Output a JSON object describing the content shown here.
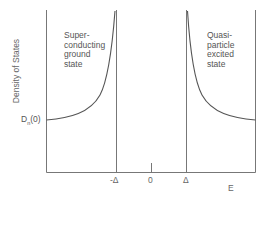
{
  "diagram": {
    "y_axis_label": "Density of States",
    "x_axis_label": "E",
    "y_reference_label": "D",
    "y_reference_subscript": "n",
    "y_reference_suffix": "(0)",
    "x_ticks": {
      "neg_gap": "-Δ",
      "zero": "0",
      "pos_gap": "Δ"
    },
    "regions": {
      "left": "Super-\nconducting\nground\nstate",
      "right": "Quasi-\nparticle\nexcited\nstate"
    },
    "colors": {
      "line": "#666666",
      "curve": "#555555",
      "text": "#555555"
    }
  }
}
